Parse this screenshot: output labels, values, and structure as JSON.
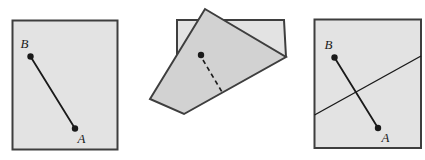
{
  "colors": {
    "background": "#ffffff",
    "paper_fill": "#e3e3e3",
    "flap_fill": "#d2d2d2",
    "outline": "#3e3e3e",
    "ink": "#1a1a1a"
  },
  "panels": {
    "original": {
      "point_b": "B",
      "point_a": "A"
    },
    "folded": {},
    "unfolded": {
      "point_b": "B",
      "point_a": "A"
    }
  }
}
